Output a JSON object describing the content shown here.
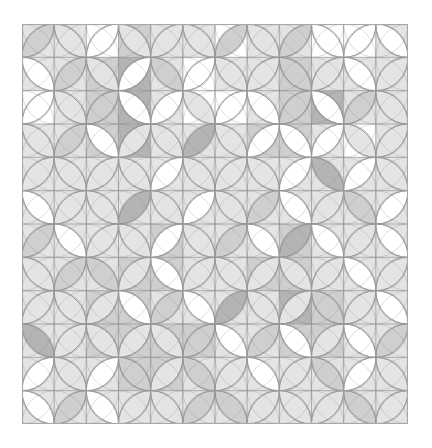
{
  "quilt": {
    "pattern": "orange-peel",
    "rows": 12,
    "cols": 12,
    "colors": {
      "paper": "#ffffff",
      "grid_line": "#9a9a9a",
      "arc_line": "#8c8c8c",
      "border": "#a8a8a8",
      "shades": [
        "#ffffff",
        "#e4e4e4",
        "#cfcfcf",
        "#b4b4b4"
      ]
    },
    "petal_shades": [
      [
        2,
        1,
        0,
        1,
        1,
        1,
        2,
        1,
        2,
        0,
        0,
        0
      ],
      [
        0,
        2,
        1,
        0,
        2,
        0,
        1,
        1,
        2,
        1,
        0,
        1
      ],
      [
        0,
        1,
        2,
        0,
        0,
        1,
        0,
        0,
        2,
        0,
        2,
        1
      ],
      [
        1,
        2,
        0,
        1,
        1,
        3,
        1,
        0,
        0,
        0,
        1,
        1
      ],
      [
        1,
        1,
        1,
        1,
        0,
        1,
        1,
        1,
        0,
        3,
        0,
        1
      ],
      [
        0,
        1,
        1,
        3,
        1,
        0,
        1,
        2,
        0,
        1,
        2,
        0
      ],
      [
        2,
        0,
        1,
        1,
        0,
        1,
        2,
        0,
        3,
        0,
        1,
        0
      ],
      [
        1,
        2,
        2,
        1,
        0,
        1,
        1,
        1,
        1,
        1,
        0,
        1
      ],
      [
        1,
        1,
        1,
        0,
        2,
        0,
        3,
        1,
        1,
        2,
        1,
        0
      ],
      [
        3,
        1,
        1,
        1,
        1,
        2,
        0,
        2,
        0,
        1,
        0,
        2
      ],
      [
        0,
        1,
        0,
        2,
        1,
        2,
        1,
        0,
        1,
        2,
        0,
        1
      ],
      [
        0,
        2,
        0,
        1,
        1,
        2,
        2,
        1,
        1,
        1,
        2,
        1
      ]
    ],
    "star_shades": [
      [
        1,
        1,
        0,
        2,
        1,
        1,
        0,
        1,
        1,
        0,
        0,
        1
      ],
      [
        1,
        1,
        2,
        3,
        1,
        0,
        1,
        1,
        2,
        1,
        1,
        1
      ],
      [
        0,
        1,
        2,
        3,
        1,
        0,
        0,
        1,
        2,
        3,
        1,
        1
      ],
      [
        1,
        1,
        2,
        3,
        1,
        1,
        1,
        2,
        2,
        1,
        0,
        1
      ],
      [
        1,
        1,
        1,
        1,
        1,
        1,
        1,
        1,
        1,
        1,
        1,
        1
      ],
      [
        1,
        1,
        1,
        1,
        1,
        1,
        1,
        1,
        1,
        1,
        1,
        1
      ],
      [
        1,
        1,
        1,
        1,
        2,
        1,
        1,
        1,
        2,
        1,
        1,
        1
      ],
      [
        1,
        1,
        1,
        2,
        2,
        1,
        1,
        2,
        2,
        1,
        1,
        1
      ],
      [
        1,
        1,
        2,
        2,
        1,
        1,
        1,
        1,
        3,
        2,
        1,
        1
      ],
      [
        1,
        1,
        2,
        2,
        2,
        2,
        1,
        1,
        2,
        2,
        1,
        1
      ],
      [
        1,
        1,
        1,
        2,
        2,
        1,
        1,
        1,
        1,
        1,
        1,
        1
      ],
      [
        1,
        1,
        1,
        1,
        1,
        1,
        1,
        1,
        1,
        1,
        1,
        1
      ]
    ]
  }
}
